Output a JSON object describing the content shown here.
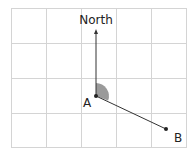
{
  "diagram": {
    "north_label": "North",
    "point_a_label": "A",
    "point_b_label": "B",
    "colors": {
      "grid": "#d4d4d4",
      "line": "#333333",
      "angle_fill": "#9a9a9a",
      "background": "#ffffff"
    },
    "grid": {
      "columns": 5,
      "rows": 4
    }
  }
}
